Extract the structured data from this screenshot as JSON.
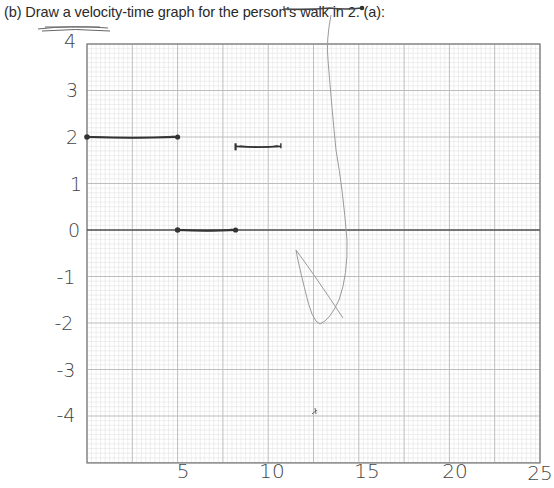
{
  "prompt": {
    "label": "(b) Draw a velocity-time graph for the person's walk in 2. (a):"
  },
  "chart_data": {
    "type": "line",
    "title": "(b) Draw a velocity-time graph for the person's walk in 2. (a):",
    "xlabel": "",
    "ylabel": "",
    "xlim": [
      0,
      25
    ],
    "ylim": [
      -4.5,
      4
    ],
    "grid": true,
    "minor_divisions_per_major": 10,
    "x_tick_labels": [
      "5",
      "10",
      "15",
      "20",
      "25"
    ],
    "x_ticks": [
      5,
      10,
      15,
      20,
      25
    ],
    "y_tick_labels": [
      "4",
      "3",
      "2",
      "1",
      "0",
      "-1",
      "-2",
      "-3",
      "-4"
    ],
    "y_ticks": [
      4,
      3,
      2,
      1,
      0,
      -1,
      -2,
      -3,
      -4
    ],
    "series": [
      {
        "name": "segment-1",
        "x": [
          0,
          5
        ],
        "y": [
          2,
          2
        ],
        "endpoints": "dots"
      },
      {
        "name": "segment-2",
        "x": [
          5,
          8.2
        ],
        "y": [
          0,
          0
        ],
        "endpoints": "dots"
      },
      {
        "name": "segment-3",
        "x": [
          8.2,
          10.7
        ],
        "y": [
          1.8,
          1.8
        ],
        "endpoints": "ticks"
      }
    ],
    "annotations": [
      {
        "type": "stray-stroke",
        "desc": "horizontal line above graph near title",
        "x_px": [
          284,
          362
        ],
        "y_px": [
          9,
          8
        ]
      },
      {
        "type": "faint-stroke",
        "desc": "faint curved loop descending from top through x~13 to y~-2"
      },
      {
        "type": "mark",
        "desc": "small mark near x~12.5, y~-4"
      }
    ]
  },
  "axes": {
    "x_labels": [
      {
        "text": "5",
        "x": 183,
        "y": 478
      },
      {
        "text": "10",
        "x": 272,
        "y": 478
      },
      {
        "text": "15",
        "x": 367,
        "y": 478
      },
      {
        "text": "20",
        "x": 455,
        "y": 478
      },
      {
        "text": "25",
        "x": 540,
        "y": 480
      }
    ],
    "y_labels": [
      {
        "text": "4",
        "x": 70,
        "y": 48
      },
      {
        "text": "3",
        "x": 72,
        "y": 97
      },
      {
        "text": "2",
        "x": 72,
        "y": 144
      },
      {
        "text": "1",
        "x": 76,
        "y": 191
      },
      {
        "text": "0",
        "x": 74,
        "y": 237
      },
      {
        "text": "-1",
        "x": 66,
        "y": 284
      },
      {
        "text": "-2",
        "x": 64,
        "y": 330
      },
      {
        "text": "-3",
        "x": 66,
        "y": 377
      },
      {
        "text": "-4",
        "x": 66,
        "y": 422
      }
    ]
  },
  "colors": {
    "ink": "#333333",
    "grid_minor": "#e2e2e2",
    "grid_major": "#bdbdbd",
    "border": "#7a7a7a",
    "zero_line": "#555555",
    "faint_pencil": "#9a9a9a"
  }
}
